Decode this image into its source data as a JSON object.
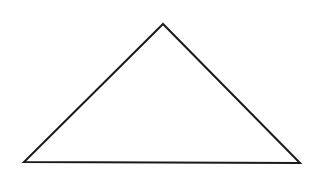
{
  "diagram": {
    "shape": "triangle",
    "background": "#ffffff",
    "stroke": "#1a1a1a",
    "stroke_width": 2,
    "fill": "#ffffff",
    "vertices": [
      {
        "x": 163,
        "y": 24
      },
      {
        "x": 24,
        "y": 162
      },
      {
        "x": 300,
        "y": 163
      }
    ]
  }
}
